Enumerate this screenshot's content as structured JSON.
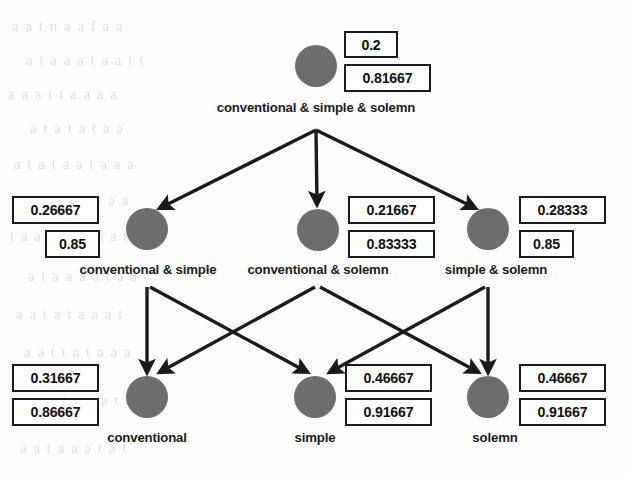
{
  "diagram": {
    "type": "hierarchy-graph",
    "node_color": "#6d6d6d",
    "box_border_color": "#1b1b1b",
    "text_color": "#1b1b1b",
    "background_color": "#fdfdfc",
    "levels": 3,
    "nodes": [
      {
        "id": "conventional-simple-solemn",
        "label": "conventional & simple & solemn",
        "value_top": "0.2",
        "value_bottom": "0.81667",
        "boxes_side": "right",
        "level": 0
      },
      {
        "id": "conventional-simple",
        "label": "conventional & simple",
        "value_top": "0.26667",
        "value_bottom": "0.85",
        "boxes_side": "left",
        "level": 1
      },
      {
        "id": "conventional-solemn",
        "label": "conventional & solemn",
        "value_top": "0.21667",
        "value_bottom": "0.83333",
        "boxes_side": "right",
        "level": 1
      },
      {
        "id": "simple-solemn",
        "label": "simple & solemn",
        "value_top": "0.28333",
        "value_bottom": "0.85",
        "boxes_side": "right",
        "level": 1
      },
      {
        "id": "conventional",
        "label": "conventional",
        "value_top": "0.31667",
        "value_bottom": "0.86667",
        "boxes_side": "left",
        "level": 2
      },
      {
        "id": "simple",
        "label": "simple",
        "value_top": "0.46667",
        "value_bottom": "0.91667",
        "boxes_side": "right",
        "level": 2
      },
      {
        "id": "solemn",
        "label": "solemn",
        "value_top": "0.46667",
        "value_bottom": "0.91667",
        "boxes_side": "right",
        "level": 2
      }
    ],
    "edges": [
      {
        "from": "conventional-simple-solemn",
        "to": "conventional-simple"
      },
      {
        "from": "conventional-simple-solemn",
        "to": "conventional-solemn"
      },
      {
        "from": "conventional-simple-solemn",
        "to": "simple-solemn"
      },
      {
        "from": "conventional-simple",
        "to": "conventional"
      },
      {
        "from": "conventional-simple",
        "to": "simple"
      },
      {
        "from": "conventional-solemn",
        "to": "conventional"
      },
      {
        "from": "conventional-solemn",
        "to": "solemn"
      },
      {
        "from": "simple-solemn",
        "to": "simple"
      },
      {
        "from": "simple-solemn",
        "to": "solemn"
      }
    ]
  },
  "background_ghost_text": [
    "a a t n a a f a a",
    "a t a a a t a a t t",
    "a a a t t a a a a",
    "a t a t a t a a",
    "a t a t a a t a a a",
    "a a t t a a t a a",
    "t a a t a a t a a t",
    "a t a a a a t a a",
    "a a t a t a a a t",
    "a a t t a t a a a",
    "a t a a t a a a t a",
    "a a t a a a t a t"
  ]
}
